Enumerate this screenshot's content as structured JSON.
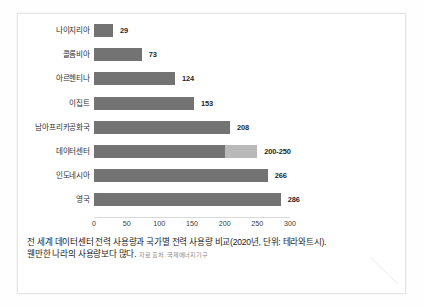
{
  "figure": {
    "name": "datacenter-electricity-bar-chart",
    "caption_line1": "전 세계 데이터센터 전력 사용량과 국가별 전력 사용량 비교(2020년, 단위: 테라와트시).",
    "caption_line2": "웬만한 나라의 사용량보다 많다.",
    "source_note": "자료 출처: 국제에너지기구"
  },
  "colors": {
    "bar_main": "#737373",
    "bar_range_extension": "#b9b9b9",
    "axis": "#d9d9d9",
    "text": "#1c1c1c",
    "frame": "#e6e6e6",
    "page": "#ffffff"
  },
  "chart_data": {
    "type": "bar",
    "orientation": "horizontal",
    "title": "",
    "subtitle": "",
    "xlabel": "",
    "ylabel": "",
    "unit": "테라와트시",
    "year": "2020",
    "xlim": [
      0,
      300
    ],
    "xticks": [
      "0",
      "50",
      "100",
      "150",
      "200",
      "250",
      "300"
    ],
    "grid": false,
    "legend": "none",
    "categories": [
      "나이지리아",
      "콜롬비아",
      "아르헨티나",
      "이집트",
      "남아프리카공화국",
      "데이터센터",
      "인도네시아",
      "영국"
    ],
    "values": [
      29,
      73,
      124,
      153,
      208,
      225,
      266,
      286
    ],
    "bars": [
      {
        "label": "나이지리아",
        "value": 29,
        "value_label": "29",
        "range": false,
        "low": 29,
        "high": 29
      },
      {
        "label": "콜롬비아",
        "value": 73,
        "value_label": "73",
        "range": false,
        "low": 73,
        "high": 73
      },
      {
        "label": "아르헨티나",
        "value": 124,
        "value_label": "124",
        "range": false,
        "low": 124,
        "high": 124
      },
      {
        "label": "이집트",
        "value": 153,
        "value_label": "153",
        "range": false,
        "low": 153,
        "high": 153
      },
      {
        "label": "남아프리카공화국",
        "value": 208,
        "value_label": "208",
        "range": false,
        "low": 208,
        "high": 208
      },
      {
        "label": "데이터센터",
        "value": 225,
        "value_label": "200-250",
        "range": true,
        "low": 200,
        "high": 250
      },
      {
        "label": "인도네시아",
        "value": 266,
        "value_label": "266",
        "range": false,
        "low": 266,
        "high": 266
      },
      {
        "label": "영국",
        "value": 286,
        "value_label": "286",
        "range": false,
        "low": 286,
        "high": 286
      }
    ]
  }
}
